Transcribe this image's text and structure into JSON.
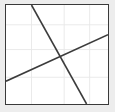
{
  "figure": {
    "title": "",
    "panel_background": "#ffffff",
    "outer_background": "#ededed",
    "border_color": "#3a3a3a",
    "grid_color": "#e8e8e8"
  },
  "chart_data": {
    "type": "line",
    "title": "",
    "xlabel": "",
    "ylabel": "",
    "xlim": [
      0,
      100
    ],
    "ylim": [
      0,
      100
    ],
    "grid": true,
    "legend": "none",
    "xticks": [
      0,
      25,
      57,
      82,
      100
    ],
    "yticks": [
      0,
      27,
      55,
      80,
      100
    ],
    "xticklabels": [
      "",
      "",
      "",
      "",
      ""
    ],
    "yticklabels": [
      "",
      "",
      "",
      "",
      ""
    ],
    "series": [
      {
        "name": "descending-line",
        "color": "#3c3c3c",
        "linewidth": 1.6,
        "x": [
          25,
          79
        ],
        "y": [
          100,
          0
        ]
      },
      {
        "name": "ascending-line",
        "color": "#3c3c3c",
        "linewidth": 1.6,
        "x": [
          0,
          100
        ],
        "y": [
          23,
          70
        ]
      }
    ],
    "annotations": []
  }
}
